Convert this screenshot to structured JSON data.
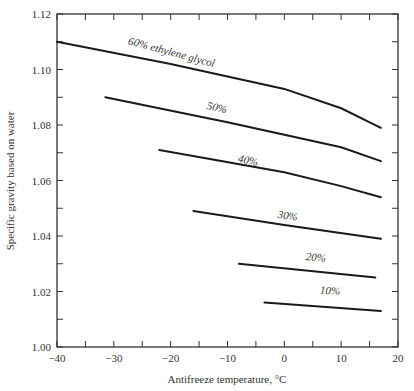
{
  "chart_data": {
    "type": "line",
    "title": "",
    "xlabel": "Antifreeze temperature, °C",
    "ylabel": "Specific gravity based on water",
    "xlim": [
      -40,
      20
    ],
    "ylim": [
      1.0,
      1.12
    ],
    "xticks": [
      -40,
      -30,
      -20,
      -10,
      0,
      10,
      20
    ],
    "xtick_labels": [
      "−40",
      "−30",
      "−20",
      "−10",
      "0",
      "10",
      "20"
    ],
    "yticks": [
      1.0,
      1.02,
      1.04,
      1.06,
      1.08,
      1.1,
      1.12
    ],
    "ytick_labels": [
      "1.00",
      "1.02",
      "1.04",
      "1.06",
      "1.08",
      "1.10",
      "1.12"
    ],
    "grid": false,
    "legend": "inline labels on curves",
    "series": [
      {
        "name": "60% ethylene glycol",
        "label": "60% ethylene glycol",
        "x": [
          -40,
          -20,
          0,
          10,
          17
        ],
        "y": [
          1.11,
          1.102,
          1.093,
          1.086,
          1.079
        ],
        "label_at": [
          -20,
          1.105
        ]
      },
      {
        "name": "50%",
        "label": "50%",
        "x": [
          -31.5,
          -10,
          10,
          17
        ],
        "y": [
          1.09,
          1.081,
          1.072,
          1.067
        ],
        "label_at": [
          -12,
          1.085
        ]
      },
      {
        "name": "40%",
        "label": "40%",
        "x": [
          -22,
          0,
          10,
          17
        ],
        "y": [
          1.071,
          1.063,
          1.058,
          1.054
        ],
        "label_at": [
          -6.5,
          1.066
        ]
      },
      {
        "name": "30%",
        "label": "30%",
        "x": [
          -16,
          0,
          17
        ],
        "y": [
          1.049,
          1.044,
          1.039
        ],
        "label_at": [
          0.5,
          1.046
        ]
      },
      {
        "name": "20%",
        "label": "20%",
        "x": [
          -8,
          16
        ],
        "y": [
          1.03,
          1.025
        ],
        "label_at": [
          5.5,
          1.031
        ]
      },
      {
        "name": "10%",
        "label": "10%",
        "x": [
          -3.5,
          17
        ],
        "y": [
          1.016,
          1.013
        ],
        "label_at": [
          8,
          1.019
        ]
      }
    ]
  }
}
